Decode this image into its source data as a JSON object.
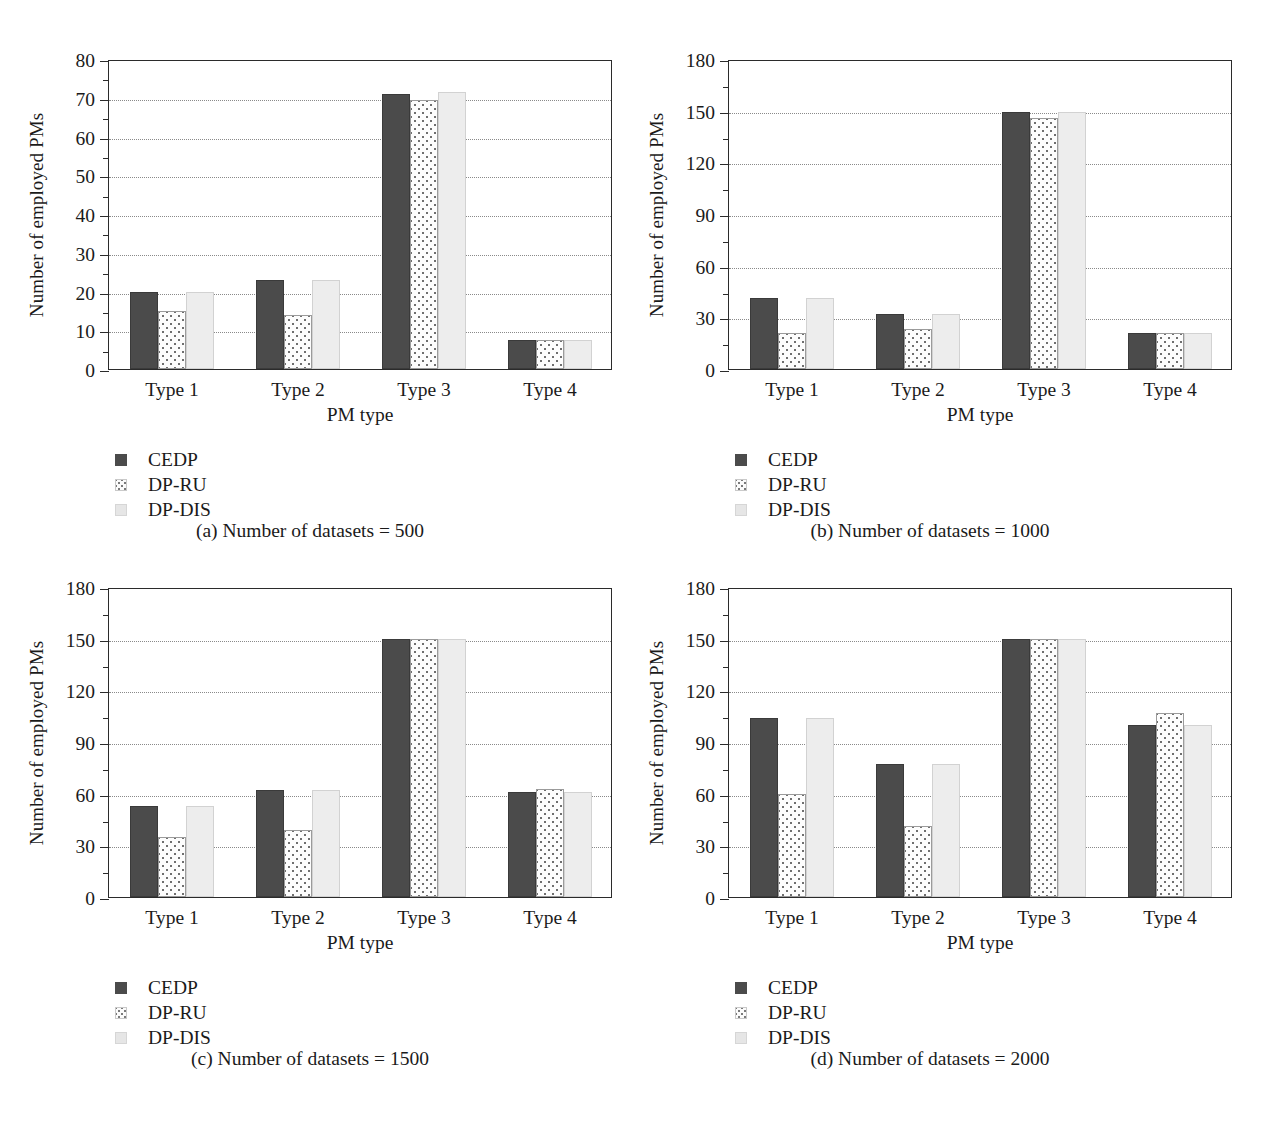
{
  "figure": {
    "axis_title_y": "Number of employed PMs",
    "axis_title_x": "PM type",
    "categories": [
      "Type 1",
      "Type 2",
      "Type 3",
      "Type 4"
    ],
    "legend": [
      {
        "name": "CEDP",
        "swatch": "solid-dark-grey-swatch"
      },
      {
        "name": "DP-RU",
        "swatch": "dotted-pattern-swatch"
      },
      {
        "name": "DP-DIS",
        "swatch": "light-grey-swatch"
      }
    ]
  },
  "panels": [
    {
      "key": "a",
      "caption": "(a)  Number of datasets = 500",
      "yticks": [
        "0",
        "10",
        "20",
        "30",
        "40",
        "50",
        "60",
        "70",
        "80"
      ]
    },
    {
      "key": "b",
      "caption": "(b)  Number of datasets = 1000",
      "yticks": [
        "0",
        "30",
        "60",
        "90",
        "120",
        "150",
        "180"
      ]
    },
    {
      "key": "c",
      "caption": "(c)  Number of datasets = 1500",
      "yticks": [
        "0",
        "30",
        "60",
        "90",
        "120",
        "150",
        "180"
      ]
    },
    {
      "key": "d",
      "caption": "(d)  Number of datasets = 2000",
      "yticks": [
        "0",
        "30",
        "60",
        "90",
        "120",
        "150",
        "180"
      ]
    }
  ],
  "chart_data": [
    {
      "type": "bar",
      "panel": "a",
      "title": "(a)  Number of datasets = 500",
      "xlabel": "PM type",
      "ylabel": "Number of employed PMs",
      "categories": [
        "Type 1",
        "Type 2",
        "Type 3",
        "Type 4"
      ],
      "ylim": [
        0,
        80
      ],
      "yticks": [
        0,
        10,
        20,
        30,
        40,
        50,
        60,
        70,
        80
      ],
      "grid": true,
      "legend_position": "below-left",
      "series": [
        {
          "name": "CEDP",
          "values": [
            20,
            23,
            71,
            7.5
          ]
        },
        {
          "name": "DP-RU",
          "values": [
            15,
            14,
            69.5,
            7.5
          ]
        },
        {
          "name": "DP-DIS",
          "values": [
            20,
            23,
            71.5,
            7.5
          ]
        }
      ]
    },
    {
      "type": "bar",
      "panel": "b",
      "title": "(b)  Number of datasets = 1000",
      "xlabel": "PM type",
      "ylabel": "Number of employed PMs",
      "categories": [
        "Type 1",
        "Type 2",
        "Type 3",
        "Type 4"
      ],
      "ylim": [
        0,
        180
      ],
      "yticks": [
        0,
        30,
        60,
        90,
        120,
        150,
        180
      ],
      "grid": true,
      "legend_position": "below-left",
      "series": [
        {
          "name": "CEDP",
          "values": [
            41,
            32,
            149,
            21
          ]
        },
        {
          "name": "DP-RU",
          "values": [
            21,
            23,
            146,
            21
          ]
        },
        {
          "name": "DP-DIS",
          "values": [
            41,
            32,
            149.5,
            21
          ]
        }
      ]
    },
    {
      "type": "bar",
      "panel": "c",
      "title": "(c)  Number of datasets = 1500",
      "xlabel": "PM type",
      "ylabel": "Number of employed PMs",
      "categories": [
        "Type 1",
        "Type 2",
        "Type 3",
        "Type 4"
      ],
      "ylim": [
        0,
        180
      ],
      "yticks": [
        0,
        30,
        60,
        90,
        120,
        150,
        180
      ],
      "grid": true,
      "legend_position": "below-left",
      "series": [
        {
          "name": "CEDP",
          "values": [
            53,
            62,
            150,
            61
          ]
        },
        {
          "name": "DP-RU",
          "values": [
            35,
            39,
            150,
            63
          ]
        },
        {
          "name": "DP-DIS",
          "values": [
            53,
            62,
            150,
            61
          ]
        }
      ]
    },
    {
      "type": "bar",
      "panel": "d",
      "title": "(d)  Number of datasets = 2000",
      "xlabel": "PM type",
      "ylabel": "Number of employed PMs",
      "categories": [
        "Type 1",
        "Type 2",
        "Type 3",
        "Type 4"
      ],
      "ylim": [
        0,
        180
      ],
      "yticks": [
        0,
        30,
        60,
        90,
        120,
        150,
        180
      ],
      "grid": true,
      "legend_position": "below-left",
      "series": [
        {
          "name": "CEDP",
          "values": [
            104,
            77,
            150,
            100
          ]
        },
        {
          "name": "DP-RU",
          "values": [
            60,
            41,
            150,
            107
          ]
        },
        {
          "name": "DP-DIS",
          "values": [
            104,
            77,
            150,
            100
          ]
        }
      ]
    }
  ]
}
